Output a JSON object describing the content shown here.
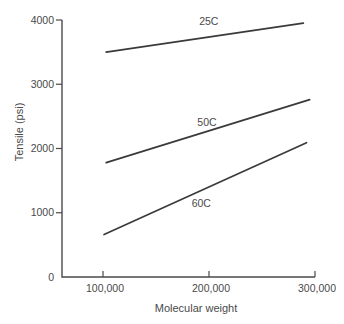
{
  "chart_data": {
    "type": "line",
    "title": "",
    "xlabel": "Molecular weight",
    "ylabel": "Tensile (psi)",
    "x_tick_values": [
      100000,
      200000,
      300000
    ],
    "x_tick_labels": [
      "100,000",
      "200,000",
      "300,000"
    ],
    "y_tick_values": [
      0,
      1000,
      2000,
      3000,
      4000
    ],
    "y_tick_labels": [
      "0",
      "1000",
      "2000",
      "3000",
      "4000"
    ],
    "ylim": [
      0,
      4000
    ],
    "grid": false,
    "legend": "inline-labels",
    "series": [
      {
        "name": "25C",
        "label_side": "above",
        "points": [
          [
            103000,
            3500
          ],
          [
            289000,
            3950
          ]
        ]
      },
      {
        "name": "50C",
        "label_side": "above",
        "points": [
          [
            103000,
            1780
          ],
          [
            295000,
            2760
          ]
        ]
      },
      {
        "name": "60C",
        "label_side": "below",
        "points": [
          [
            101000,
            660
          ],
          [
            292000,
            2090
          ]
        ]
      }
    ],
    "colors": {
      "line": "#3a3a3a",
      "axis": "#4a4a4a",
      "text": "#4a4a4a"
    }
  }
}
